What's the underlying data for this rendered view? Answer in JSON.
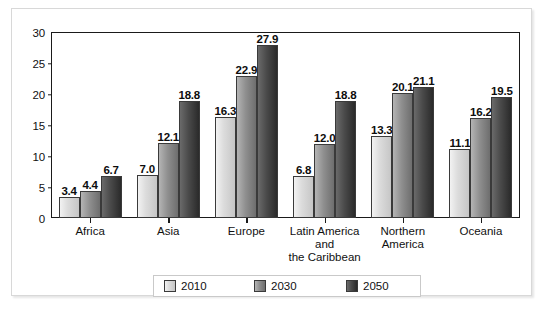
{
  "chart_data": {
    "type": "bar",
    "title": "",
    "subtitle": "",
    "xlabel": "",
    "ylabel": "",
    "ylim": [
      0,
      30
    ],
    "yticks": [
      "0",
      "5",
      "10",
      "15",
      "20",
      "25",
      "30"
    ],
    "ytick_values": [
      0,
      5,
      10,
      15,
      20,
      25,
      30
    ],
    "grid": false,
    "legend_position": "bottom",
    "categories": [
      "Africa",
      "Asia",
      "Europe",
      "Latin America\nand\nthe Caribbean",
      "Northern\nAmerica",
      "Oceania"
    ],
    "category_lines": [
      [
        "Africa"
      ],
      [
        "Asia"
      ],
      [
        "Europe"
      ],
      [
        "Latin America",
        "and",
        "the Caribbean"
      ],
      [
        "Northern",
        "America"
      ],
      [
        "Oceania"
      ]
    ],
    "series": [
      {
        "name": "2010",
        "color": "#dcdcdc",
        "values": [
          3.4,
          7.0,
          16.3,
          6.8,
          13.3,
          11.1
        ],
        "labels": [
          "3.4",
          "7.0",
          "16.3",
          "6.8",
          "13.3",
          "11.1"
        ]
      },
      {
        "name": "2030",
        "color": "#8f8f8f",
        "values": [
          4.4,
          12.1,
          22.9,
          12.0,
          20.1,
          16.2
        ],
        "labels": [
          "4.4",
          "12.1",
          "22.9",
          "12.0",
          "20.1",
          "16.2"
        ]
      },
      {
        "name": "2050",
        "color": "#2f2f2f",
        "values": [
          6.7,
          18.8,
          27.9,
          18.8,
          21.1,
          19.5
        ],
        "labels": [
          "6.7",
          "18.8",
          "27.9",
          "18.8",
          "21.1",
          "19.5"
        ]
      }
    ]
  },
  "legend": {
    "items": [
      {
        "label": "2010"
      },
      {
        "label": "2030"
      },
      {
        "label": "2050"
      }
    ]
  }
}
